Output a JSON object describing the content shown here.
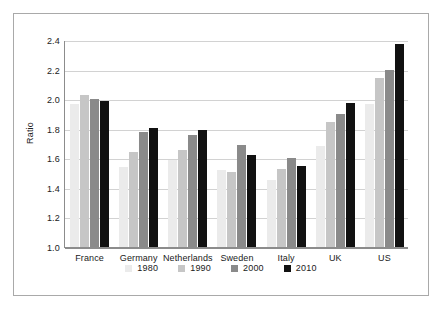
{
  "chart_data": {
    "type": "bar",
    "title": "",
    "xlabel": "",
    "ylabel": "Ratio",
    "ylim": [
      1.0,
      2.4
    ],
    "ytick_labels": [
      "2.4",
      "2.2",
      "2.0",
      "1.8",
      "1.6",
      "1.4",
      "1.2",
      "1.0"
    ],
    "yticks": [
      2.4,
      2.2,
      2.0,
      1.8,
      1.6,
      1.4,
      1.2,
      1.0
    ],
    "grid": true,
    "legend_position": "bottom",
    "categories": [
      "France",
      "Germany",
      "Netherlands",
      "Sweden",
      "Italy",
      "UK",
      "US"
    ],
    "series": [
      {
        "name": "1980",
        "color": "#ebebeb",
        "values": [
          1.97,
          1.54,
          1.59,
          1.52,
          1.45,
          1.68,
          1.97
        ]
      },
      {
        "name": "1990",
        "color": "#c6c6c6",
        "values": [
          2.03,
          1.64,
          1.655,
          1.51,
          1.525,
          1.845,
          2.14
        ]
      },
      {
        "name": "2000",
        "color": "#8a8a8a",
        "values": [
          2.0,
          1.775,
          1.755,
          1.69,
          1.6,
          1.9,
          2.195
        ]
      },
      {
        "name": "2010",
        "color": "#111111",
        "values": [
          1.985,
          1.805,
          1.79,
          1.62,
          1.55,
          1.975,
          2.37
        ]
      }
    ]
  }
}
